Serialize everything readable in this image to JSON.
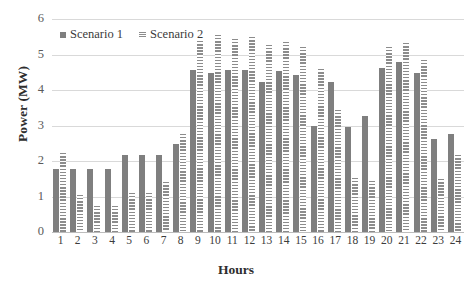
{
  "chart_data": {
    "type": "bar",
    "title": "",
    "xlabel": "Hours",
    "ylabel": "Power (MW)",
    "ylim": [
      0,
      6
    ],
    "yticks": [
      0,
      1,
      2,
      3,
      4,
      5,
      6
    ],
    "grid": true,
    "legend_position": "top-left",
    "categories": [
      "1",
      "2",
      "3",
      "4",
      "5",
      "6",
      "7",
      "8",
      "9",
      "10",
      "11",
      "12",
      "13",
      "14",
      "15",
      "16",
      "17",
      "18",
      "19",
      "20",
      "21",
      "22",
      "23",
      "24"
    ],
    "series": [
      {
        "name": "Scenario 1",
        "color": "#7f7f7f",
        "values": [
          1.78,
          1.78,
          1.78,
          1.78,
          2.17,
          2.17,
          2.17,
          2.48,
          4.55,
          4.47,
          4.55,
          4.55,
          4.23,
          4.53,
          4.43,
          3.0,
          4.22,
          2.97,
          3.26,
          4.62,
          4.8,
          4.47,
          2.62,
          2.77
        ]
      },
      {
        "name": "Scenario 2",
        "color": "#8c8c8c",
        "values": [
          2.22,
          1.05,
          0.73,
          0.73,
          1.1,
          1.1,
          1.4,
          2.75,
          5.37,
          5.55,
          5.43,
          5.5,
          5.27,
          5.35,
          5.2,
          4.58,
          3.43,
          1.53,
          1.45,
          5.2,
          5.33,
          4.85,
          1.5,
          2.18
        ]
      }
    ]
  },
  "legend": {
    "entries": [
      {
        "label": "Scenario 1",
        "marker": "solid-square-icon"
      },
      {
        "label": "Scenario 2",
        "marker": "striped-square-icon"
      }
    ]
  },
  "axes": {
    "y_title": "Power (MW)",
    "x_title": "Hours",
    "y_tick_labels": [
      "6",
      "5",
      "4",
      "3",
      "2",
      "1",
      "0"
    ],
    "x_tick_labels": [
      "1",
      "2",
      "3",
      "4",
      "5",
      "6",
      "7",
      "8",
      "9",
      "10",
      "11",
      "12",
      "13",
      "14",
      "15",
      "16",
      "17",
      "18",
      "19",
      "20",
      "21",
      "22",
      "23",
      "24"
    ]
  }
}
